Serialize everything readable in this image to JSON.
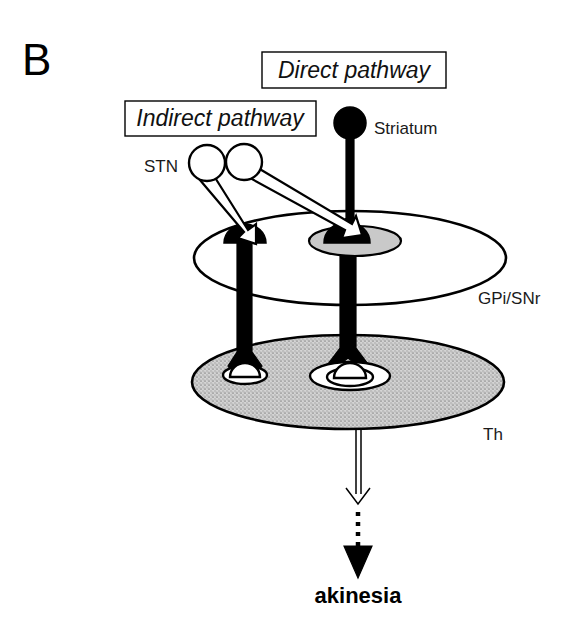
{
  "figure": {
    "panel_letter": "B",
    "background_color": "#ffffff",
    "width": 579,
    "height": 626
  },
  "pathway_boxes": [
    {
      "id": "direct",
      "label": "Direct pathway"
    },
    {
      "id": "indirect",
      "label": "Indirect pathway"
    }
  ],
  "structures": {
    "stn": {
      "label": "STN",
      "neuron_fill": "#ffffff",
      "neuron_count": 2,
      "terminal_type": "open-excitatory-arrowhead"
    },
    "striatum": {
      "label": "Striatum",
      "neuron_fill": "#000000",
      "neuron_count": 1,
      "terminal_type": "filled-inhibitory-terminal"
    },
    "gpi_snr": {
      "label": "GPi/SNr",
      "disc_fill": "#ffffff",
      "neuron_fill": "#000000",
      "neuron_count": 2,
      "halo_color": "#c9c9c9",
      "terminal_type": "filled-inhibitory-terminal"
    },
    "thalamus": {
      "label": "Th",
      "disc_fill": "#cccccc",
      "disc_texture": "stipple",
      "neuron_fill": "#ffffff",
      "neuron_count": 2,
      "terminal_type": "open-excitatory-arrowhead"
    }
  },
  "outcome": {
    "label": "akinesia",
    "connector": "dotted-arrow"
  }
}
